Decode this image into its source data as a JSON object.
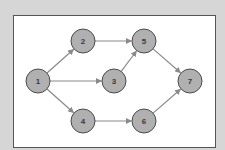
{
  "colors": {
    "background": "#d6d6d6",
    "frame_fill": "#ffffff",
    "frame_border": "#555555",
    "node_fill": "#b0b0b0",
    "node_border": "#4a4a4a",
    "edge": "#8a8a8a",
    "label": "#3a3a3a"
  },
  "frame": {
    "x": 13,
    "y": 15,
    "width": 202,
    "height": 132
  },
  "nodes": [
    {
      "id": "1",
      "label": "1",
      "x": 38,
      "y": 81
    },
    {
      "id": "2",
      "label": "2",
      "x": 83,
      "y": 41
    },
    {
      "id": "3",
      "label": "3",
      "x": 114,
      "y": 81
    },
    {
      "id": "4",
      "label": "4",
      "x": 83,
      "y": 121
    },
    {
      "id": "5",
      "label": "5",
      "x": 144,
      "y": 41
    },
    {
      "id": "6",
      "label": "6",
      "x": 144,
      "y": 121
    },
    {
      "id": "7",
      "label": "7",
      "x": 190,
      "y": 81
    }
  ],
  "node_radius": 12,
  "edges": [
    {
      "from": "1",
      "to": "2"
    },
    {
      "from": "1",
      "to": "3"
    },
    {
      "from": "1",
      "to": "4"
    },
    {
      "from": "2",
      "to": "5"
    },
    {
      "from": "3",
      "to": "5"
    },
    {
      "from": "4",
      "to": "6"
    },
    {
      "from": "5",
      "to": "7"
    },
    {
      "from": "6",
      "to": "7"
    }
  ]
}
